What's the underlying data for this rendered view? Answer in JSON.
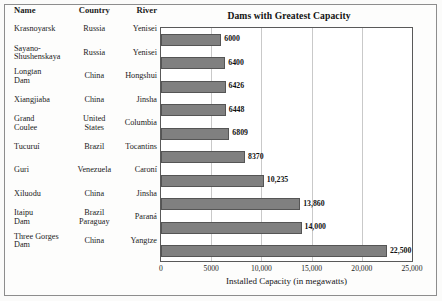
{
  "table": {
    "columns": [
      "Name",
      "Country",
      "River"
    ],
    "rows": [
      {
        "name": [
          "Krasnoyarsk"
        ],
        "country": [
          "Russia"
        ],
        "river": [
          "Yenisei"
        ]
      },
      {
        "name": [
          "Sayano-",
          "Shushenskaya"
        ],
        "country": [
          "Russia"
        ],
        "river": [
          "Yenisei"
        ]
      },
      {
        "name": [
          "Longtan",
          "Dam"
        ],
        "country": [
          "China"
        ],
        "river": [
          "Hongshui"
        ]
      },
      {
        "name": [
          "Xiangjiaba"
        ],
        "country": [
          "China"
        ],
        "river": [
          "Jinsha"
        ]
      },
      {
        "name": [
          "Grand",
          "Coulee"
        ],
        "country": [
          "United",
          "States"
        ],
        "river": [
          "Columbia"
        ]
      },
      {
        "name": [
          "Tucuruí"
        ],
        "country": [
          "Brazil"
        ],
        "river": [
          "Tocantins"
        ]
      },
      {
        "name": [
          "Guri"
        ],
        "country": [
          "Venezuela"
        ],
        "river": [
          "Caroní"
        ]
      },
      {
        "name": [
          "Xiluodu"
        ],
        "country": [
          "China"
        ],
        "river": [
          "Jinsha"
        ]
      },
      {
        "name": [
          "Itaipu",
          "Dam"
        ],
        "country": [
          "Brazil",
          "Paraguay"
        ],
        "river": [
          "Paraná"
        ]
      },
      {
        "name": [
          "Three Gorges",
          "Dam"
        ],
        "country": [
          "China"
        ],
        "river": [
          "Yangtze"
        ]
      }
    ]
  },
  "chart_data": {
    "type": "bar",
    "orientation": "horizontal",
    "title": "Dams with Greatest Capacity",
    "xlabel": "Installed Capacity (in megawatts)",
    "ylabel": "",
    "xlim": [
      0,
      25000
    ],
    "grid": true,
    "legend": "none",
    "bar_color": "#808080",
    "xticks": [
      0,
      5000,
      10000,
      15000,
      20000,
      25000
    ],
    "xtick_labels": [
      "0",
      "5000",
      "10,000",
      "15,000",
      "20,000",
      "25,000"
    ],
    "categories": [
      "Krasnoyarsk",
      "Sayano-Shushenskaya",
      "Longtan Dam",
      "Xiangjiaba",
      "Grand Coulee",
      "Tucuruí",
      "Guri",
      "Xiluodu",
      "Itaipu Dam",
      "Three Gorges Dam"
    ],
    "values": [
      6000,
      6400,
      6426,
      6448,
      6809,
      8370,
      10235,
      13860,
      14000,
      22500
    ],
    "data_labels": [
      "6000",
      "6400",
      "6426",
      "6448",
      "6809",
      "8370",
      "10,235",
      "13,860",
      "14,000",
      "22,500"
    ]
  }
}
